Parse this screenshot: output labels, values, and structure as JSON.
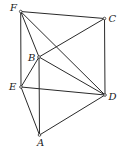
{
  "diagram": {
    "type": "geometry-figure",
    "points": [
      {
        "id": "F",
        "label": "F",
        "x": 20.7,
        "y": 11.5,
        "lx": 10,
        "ly": 11
      },
      {
        "id": "C",
        "label": "C",
        "x": 104.5,
        "y": 18.5,
        "lx": 108.5,
        "ly": 22
      },
      {
        "id": "B",
        "label": "B",
        "x": 39,
        "y": 57,
        "lx": 28,
        "ly": 61
      },
      {
        "id": "E",
        "label": "E",
        "x": 21,
        "y": 87,
        "lx": 9,
        "ly": 90
      },
      {
        "id": "D",
        "label": "D",
        "x": 105,
        "y": 95,
        "lx": 108.5,
        "ly": 100
      },
      {
        "id": "A",
        "label": "A",
        "x": 39.5,
        "y": 135,
        "lx": 37,
        "ly": 146
      }
    ],
    "edges": [
      [
        "F",
        "C"
      ],
      [
        "F",
        "E"
      ],
      [
        "F",
        "B"
      ],
      [
        "F",
        "D"
      ],
      [
        "C",
        "B"
      ],
      [
        "C",
        "D"
      ],
      [
        "B",
        "E"
      ],
      [
        "B",
        "D"
      ],
      [
        "B",
        "A"
      ],
      [
        "E",
        "D"
      ],
      [
        "E",
        "A"
      ],
      [
        "A",
        "D"
      ]
    ]
  }
}
